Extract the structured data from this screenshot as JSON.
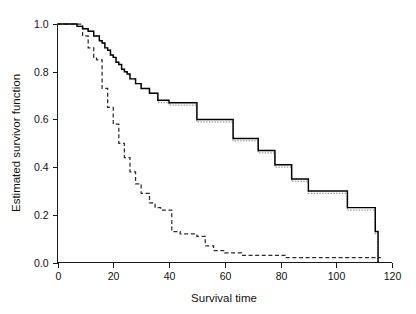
{
  "chart_data": {
    "type": "line",
    "title": "",
    "subtitle": "",
    "xlabel": "Survival time",
    "ylabel": "Estimated survivor function",
    "xlim": [
      0,
      120
    ],
    "ylim": [
      0.0,
      1.0
    ],
    "xticks": [
      0,
      20,
      40,
      60,
      80,
      100,
      120
    ],
    "xticklabels": [
      "0",
      "20",
      "40",
      "60",
      "80",
      "100",
      "120"
    ],
    "yticks": [
      0.0,
      0.2,
      0.4,
      0.6,
      0.8,
      1.0
    ],
    "yticklabels": [
      "0.0",
      "0.2",
      "0.4",
      "0.6",
      "0.8",
      "1.0"
    ],
    "grid": false,
    "legend": "none",
    "axes_style": "left-and-bottom-spines",
    "series": [
      {
        "name": "group-1-solid-step",
        "style": "solid",
        "color": "#000000",
        "step": "post",
        "x": [
          0,
          3,
          5,
          7,
          9,
          11,
          13,
          15,
          16,
          17,
          18,
          19,
          20,
          21,
          22,
          23,
          24,
          25,
          26,
          28,
          30,
          33,
          36,
          40,
          43,
          47,
          50,
          53,
          57,
          60,
          63,
          68,
          72,
          78,
          84,
          90,
          96,
          104,
          109,
          114,
          115
        ],
        "y": [
          1.0,
          1.0,
          1.0,
          0.99,
          0.98,
          0.97,
          0.95,
          0.93,
          0.92,
          0.9,
          0.89,
          0.87,
          0.86,
          0.84,
          0.83,
          0.81,
          0.8,
          0.79,
          0.77,
          0.75,
          0.73,
          0.71,
          0.68,
          0.67,
          0.67,
          0.67,
          0.6,
          0.6,
          0.6,
          0.6,
          0.52,
          0.52,
          0.47,
          0.41,
          0.35,
          0.3,
          0.3,
          0.23,
          0.23,
          0.13,
          0.0
        ]
      },
      {
        "name": "group-1-dotted-overlay",
        "style": "dotted",
        "color": "#9a9a9a",
        "step": "post",
        "x": [
          0,
          3,
          5,
          7,
          9,
          11,
          13,
          15,
          16,
          17,
          18,
          19,
          20,
          21,
          22,
          23,
          24,
          25,
          26,
          28,
          30,
          33,
          36,
          40,
          43,
          47,
          50,
          53,
          57,
          60,
          63,
          68,
          72,
          78,
          84,
          90,
          96,
          104,
          109,
          114,
          115
        ],
        "y": [
          1.0,
          1.0,
          1.0,
          0.99,
          0.98,
          0.97,
          0.95,
          0.93,
          0.92,
          0.9,
          0.89,
          0.87,
          0.86,
          0.84,
          0.83,
          0.81,
          0.8,
          0.79,
          0.77,
          0.75,
          0.73,
          0.71,
          0.67,
          0.66,
          0.66,
          0.66,
          0.59,
          0.59,
          0.59,
          0.59,
          0.51,
          0.51,
          0.46,
          0.4,
          0.34,
          0.29,
          0.29,
          0.22,
          0.22,
          0.12,
          0.0
        ]
      },
      {
        "name": "group-2-dashed-step",
        "style": "dashed",
        "color": "#2b2b2b",
        "step": "post",
        "x": [
          0,
          5,
          8,
          9,
          11,
          13,
          14,
          16,
          18,
          20,
          22,
          24,
          26,
          28,
          30,
          33,
          35,
          37,
          39,
          41,
          44,
          47,
          50,
          53,
          56,
          60,
          66,
          74,
          82,
          90,
          100,
          110,
          116
        ],
        "y": [
          1.0,
          1.0,
          1.0,
          0.95,
          0.9,
          0.86,
          0.85,
          0.73,
          0.65,
          0.58,
          0.5,
          0.44,
          0.38,
          0.33,
          0.29,
          0.25,
          0.23,
          0.22,
          0.22,
          0.13,
          0.12,
          0.12,
          0.11,
          0.07,
          0.05,
          0.04,
          0.03,
          0.03,
          0.02,
          0.02,
          0.02,
          0.02,
          0.02
        ]
      }
    ]
  },
  "axes": {
    "x_title": "Survival time",
    "y_title": "Estimated survivor function"
  }
}
